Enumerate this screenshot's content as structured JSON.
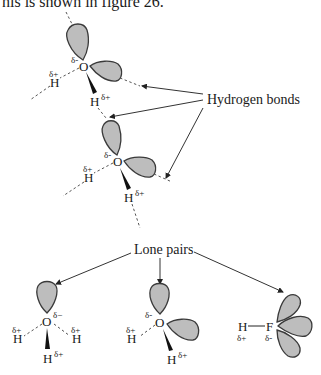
{
  "caption": "his is shown in figure 26.",
  "labels": {
    "hydrogen_bonds": "Hydrogen bonds",
    "lone_pairs": "Lone pairs"
  },
  "atoms": {
    "O": "O",
    "H": "H",
    "F": "F"
  },
  "charges": {
    "delta_plus": "δ+",
    "delta_minus": "δ−",
    "delta_minus_short": "δ-"
  },
  "molecules": {
    "top_chain": [
      {
        "id": "water-1",
        "atoms": [
          "O",
          "H",
          "H"
        ],
        "lone_pairs": 2
      },
      {
        "id": "water-2",
        "atoms": [
          "O",
          "H",
          "H"
        ],
        "lone_pairs": 2
      }
    ],
    "bottom_row": [
      {
        "id": "hydronium-like",
        "label": "O with 3 H",
        "lone_pairs": 1
      },
      {
        "id": "water",
        "label": "O with 2 H",
        "lone_pairs": 2
      },
      {
        "id": "hydrogen-fluoride",
        "label": "H—F",
        "lone_pairs": 3
      }
    ]
  },
  "colors": {
    "lobe_fill": "#bdbdbd",
    "lobe_stroke": "#3a3a3a",
    "text": "#1a1a1a"
  }
}
